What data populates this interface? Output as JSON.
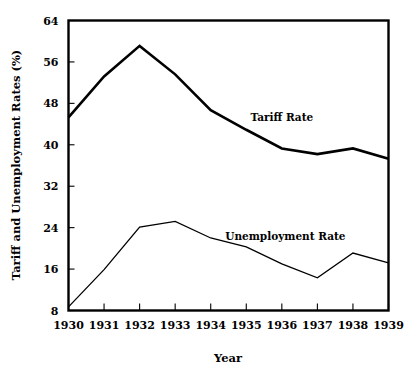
{
  "chart_data": {
    "type": "line",
    "title": "",
    "xlabel": "Year",
    "ylabel": "Tariff and Unemployment Rates (%)",
    "categories": [
      "1930",
      "1931",
      "1932",
      "1933",
      "1934",
      "1935",
      "1936",
      "1937",
      "1938",
      "1939"
    ],
    "x": [
      1930,
      1931,
      1932,
      1933,
      1934,
      1935,
      1936,
      1937,
      1938,
      1939
    ],
    "xlim": [
      1930,
      1939
    ],
    "ylim": [
      8,
      64
    ],
    "yticks": [
      "8",
      "16",
      "24",
      "32",
      "40",
      "48",
      "56",
      "64"
    ],
    "ytick_values": [
      8,
      16,
      24,
      32,
      40,
      48,
      56,
      64
    ],
    "grid": false,
    "legend_position": "inline-annotation",
    "series": [
      {
        "name": "Tariff Rate",
        "label_x": 1936.0,
        "label_y": 44.5,
        "line_width": 2.6,
        "values": [
          45.3,
          53.2,
          59.1,
          53.6,
          46.7,
          42.9,
          39.3,
          38.2,
          39.3,
          37.3
        ]
      },
      {
        "name": "Unemployment Rate",
        "label_x": 1936.1,
        "label_y": 21.6,
        "line_width": 1.3,
        "values": [
          8.7,
          15.9,
          24.1,
          25.2,
          22.0,
          20.3,
          17.0,
          14.3,
          19.1,
          17.2
        ]
      }
    ],
    "annotations": [
      {
        "text": "Tariff Rate",
        "series": "Tariff Rate"
      },
      {
        "text": "Unemployment Rate",
        "series": "Unemployment Rate"
      }
    ],
    "colors": {
      "background": "#ffffff",
      "axis": "#000000",
      "tariff_line": "#000000",
      "unemployment_line": "#000000",
      "text": "#000000"
    }
  }
}
